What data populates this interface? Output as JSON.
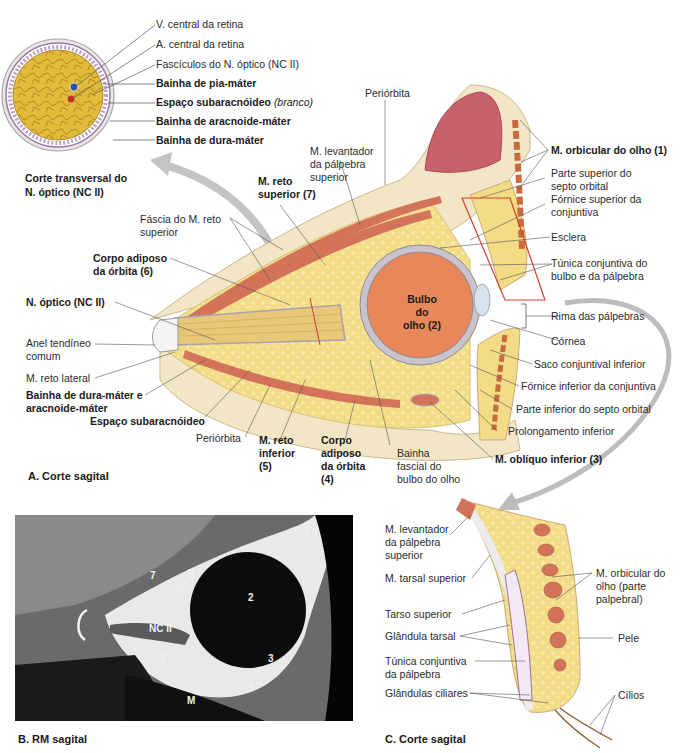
{
  "panel_a": {
    "caption": "A. Corte sagital",
    "cross_section": {
      "caption_line1": "Corte transversal do",
      "caption_line2": "N. óptico (NC II)",
      "labels": {
        "v_central": "V. central da retina",
        "a_central": "A. central da retina",
        "fasciculos": "Fascículos do N. óptico (NC II)",
        "pia": "Bainha de pia-máter",
        "subarac": "Espaço subaracnóideo",
        "subarac_note": "(branco)",
        "aracnoide": "Bainha de aracnoide-máter",
        "dura": "Bainha de dura-máter"
      }
    },
    "labels": {
      "periorbita_top": "Periórbita",
      "levantador_1": "M. levantador",
      "levantador_2": "da pálpebra",
      "levantador_3": "superior",
      "reto_sup_1": "M. reto",
      "reto_sup_2": "superior (7)",
      "fascia_1": "Fáscia do M. reto",
      "fascia_2": "superior",
      "corpo6_1": "Corpo adiposo",
      "corpo6_2": "da órbita (6)",
      "n_optico": "N. óptico (NC II)",
      "anel_1": "Anel tendíneo",
      "anel_2": "comum",
      "reto_lat": "M. reto lateral",
      "bainha_dura_1": "Bainha de dura-máter e",
      "bainha_dura_2": "aracnoide-máter",
      "esp_subarac": "Espaço subaracnóideo",
      "periorbita_bot": "Periórbita",
      "reto_inf_1": "M. reto",
      "reto_inf_2": "inferior",
      "reto_inf_3": "(5)",
      "corpo4_1": "Corpo",
      "corpo4_2": "adiposo",
      "corpo4_3": "da órbita",
      "corpo4_4": "(4)",
      "bainha_fasc_1": "Bainha",
      "bainha_fasc_2": "fascial do",
      "bainha_fasc_3": "bulbo do olho",
      "bulbo_1": "Bulbo do",
      "bulbo_2": "olho (2)",
      "orbicular": "M. orbicular do olho (1)",
      "septo_sup_1": "Parte superior do",
      "septo_sup_2": "septo orbital",
      "fornice_sup_1": "Fórnice superior da",
      "fornice_sup_2": "conjuntiva",
      "esclera": "Esclera",
      "tunica_1": "Túnica conjuntiva do",
      "tunica_2": "bulbo e da pálpebra",
      "rima": "Rima das pálpebras",
      "cornea": "Córnea",
      "saco": "Saco conjuntival inferior",
      "fornice_inf": "Fórnice inferior da conjuntiva",
      "septo_inf": "Parte inferior do septo orbital",
      "prolong": "Prolongamento inferior",
      "obliquo": "M. oblíquo inferior (3)"
    }
  },
  "panel_b": {
    "caption": "B. RM sagital",
    "markers": [
      "1",
      "2",
      "3",
      "4",
      "5",
      "7",
      "S",
      "NC II",
      "M"
    ]
  },
  "panel_c": {
    "caption": "C. Corte sagital",
    "labels": {
      "levantador_1": "M. levantador",
      "levantador_2": "da pálpebra",
      "levantador_3": "superior",
      "tarsal_sup": "M. tarsal superior",
      "tarso_sup": "Tarso superior",
      "glandula_tarsal": "Glândula tarsal",
      "tunica_1": "Túnica conjuntiva",
      "tunica_2": "da pálpebra",
      "glandulas_ciliares": "Glândulas ciliares",
      "orbicular_1": "M. orbicular do",
      "orbicular_2": "olho (parte",
      "orbicular_3": "palpebral)",
      "pele": "Pele",
      "cilios": "Cílios"
    }
  },
  "colors": {
    "fat": "#f3dc86",
    "fat_light": "#f7e8b0",
    "muscle": "#d2735a",
    "eyeball": "#e8875a",
    "sclera": "#c9c3cc",
    "bone": "#f2e6c6",
    "sinus": "#c9616b",
    "arrow": "#b9b9b9",
    "highlight_box": "#d9412d"
  }
}
